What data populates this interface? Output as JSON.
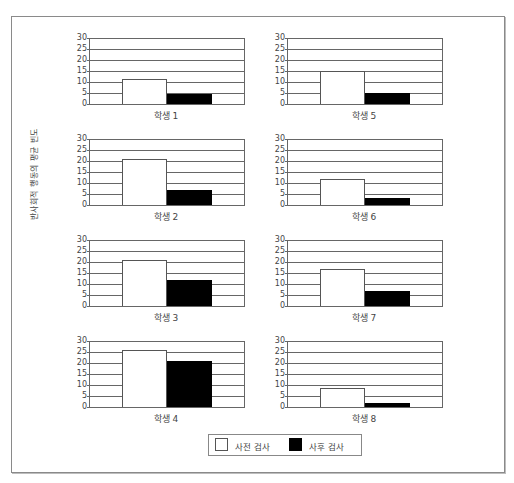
{
  "chart_data": {
    "type": "bar",
    "ylabel": "반사회적 행동의 평균 빈도",
    "ylim": [
      0,
      30
    ],
    "yticks": [
      0,
      5,
      10,
      15,
      20,
      25,
      30
    ],
    "grid": true,
    "legend": {
      "position": "bottom-center",
      "entries": [
        {
          "name": "사전 검사",
          "color": "#ffffff"
        },
        {
          "name": "사후 검사",
          "color": "#000000"
        }
      ]
    },
    "panels": [
      {
        "title": "학생 1",
        "categories": [
          "사전 검사",
          "사후 검사"
        ],
        "values": [
          11.5,
          4.5
        ]
      },
      {
        "title": "학생 2",
        "categories": [
          "사전 검사",
          "사후 검사"
        ],
        "values": [
          21,
          7
        ]
      },
      {
        "title": "학생 3",
        "categories": [
          "사전 검사",
          "사후 검사"
        ],
        "values": [
          21,
          12
        ]
      },
      {
        "title": "학생 4",
        "categories": [
          "사전 검사",
          "사후 검사"
        ],
        "values": [
          26,
          21
        ]
      },
      {
        "title": "학생 5",
        "categories": [
          "사전 검사",
          "사후 검사"
        ],
        "values": [
          15,
          5
        ]
      },
      {
        "title": "학생 6",
        "categories": [
          "사전 검사",
          "사후 검사"
        ],
        "values": [
          12,
          3
        ]
      },
      {
        "title": "학생 7",
        "categories": [
          "사전 검사",
          "사후 검사"
        ],
        "values": [
          17,
          7
        ]
      },
      {
        "title": "학생 8",
        "categories": [
          "사전 검사",
          "사후 검사"
        ],
        "values": [
          8.5,
          2
        ]
      }
    ]
  },
  "labels": {
    "ylabel": "반사회적 행동의 평균 빈도",
    "legend_pre": "사전 검사",
    "legend_post": "사후 검사"
  },
  "colors": {
    "pre": "#ffffff",
    "post": "#000000",
    "axis": "#666666"
  }
}
